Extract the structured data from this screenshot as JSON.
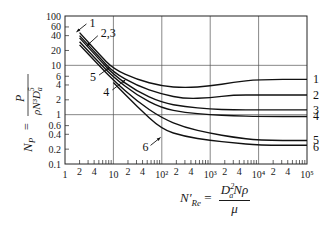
{
  "chart_data": {
    "type": "line",
    "scale": {
      "x": "log",
      "y": "log"
    },
    "title": "",
    "xlabel": "N'_Re = D_a^2 N ρ / μ",
    "ylabel": "N_P = P / (ρ N^3 D_a^5)",
    "xlim": [
      1,
      100000
    ],
    "ylim": [
      0.1,
      100
    ],
    "x_ticks": [
      "1",
      "2",
      "4",
      "10",
      "2",
      "4",
      "10²",
      "2",
      "4",
      "10³",
      "2",
      "4",
      "10⁴",
      "2",
      "4",
      "10⁵"
    ],
    "y_ticks": [
      "0.1",
      "0.2",
      "0.4",
      "0.6",
      "1",
      "2",
      "4",
      "6",
      "10",
      "20",
      "40",
      "60",
      "100"
    ],
    "grid": true,
    "grid_lines": {
      "x": [
        10,
        100,
        1000,
        10000
      ],
      "y": [
        1,
        10
      ]
    },
    "series": [
      {
        "name": "1",
        "x": [
          2,
          5,
          10,
          30,
          100,
          300,
          1000,
          3000,
          10000,
          100000
        ],
        "y": [
          46,
          17,
          8.5,
          5.2,
          3.8,
          3.5,
          3.8,
          4.5,
          5.2,
          5.2
        ]
      },
      {
        "name": "2",
        "x": [
          2,
          5,
          10,
          30,
          100,
          300,
          1000,
          3000,
          10000,
          100000
        ],
        "y": [
          40,
          15,
          7.2,
          3.9,
          2.6,
          2.1,
          2.2,
          2.5,
          2.5,
          2.5
        ]
      },
      {
        "name": "3",
        "x": [
          2,
          5,
          10,
          30,
          100,
          300,
          1000,
          3000,
          10000,
          100000
        ],
        "y": [
          36,
          13.5,
          6.5,
          3.0,
          1.75,
          1.45,
          1.3,
          1.25,
          1.25,
          1.25
        ]
      },
      {
        "name": "4",
        "x": [
          2,
          5,
          10,
          30,
          100,
          300,
          1000,
          3000,
          10000,
          100000
        ],
        "y": [
          30,
          11.5,
          5.8,
          2.5,
          1.35,
          1.1,
          1.0,
          0.95,
          0.92,
          0.92
        ]
      },
      {
        "name": "5",
        "x": [
          2,
          5,
          10,
          30,
          100,
          300,
          1000,
          3000,
          10000,
          100000
        ],
        "y": [
          26,
          10,
          5.0,
          1.9,
          0.85,
          0.55,
          0.42,
          0.35,
          0.3,
          0.3
        ]
      },
      {
        "name": "6",
        "x": [
          10,
          30,
          100,
          300,
          1000,
          3000,
          10000,
          100000
        ],
        "y": [
          4.5,
          1.5,
          0.5,
          0.36,
          0.3,
          0.27,
          0.24,
          0.24
        ]
      }
    ],
    "annotations": [
      {
        "text": "1",
        "at": "left",
        "x": 3.2,
        "y": 60
      },
      {
        "text": "2,3",
        "at": "left",
        "x": 5.5,
        "y": 38
      },
      {
        "text": "5",
        "at": "left",
        "x": 3.3,
        "y": 4.8
      },
      {
        "text": "4",
        "at": "left",
        "x": 6.2,
        "y": 2.4
      },
      {
        "text": "6",
        "at": "middle",
        "x": 40,
        "y": 0.18
      },
      {
        "text": "1",
        "at": "right",
        "y": 5.2
      },
      {
        "text": "2",
        "at": "right",
        "y": 2.5
      },
      {
        "text": "3",
        "at": "right",
        "y": 1.25
      },
      {
        "text": "4",
        "at": "right",
        "y": 0.92
      },
      {
        "text": "5",
        "at": "right",
        "y": 0.3
      },
      {
        "text": "6",
        "at": "right",
        "y": 0.22
      }
    ]
  },
  "labels": {
    "y_lhs": "N",
    "y_lhs_sub": "P",
    "y_eq": "=",
    "y_num": "P",
    "y_den": "ρN³D",
    "y_den_sub": "a",
    "y_den_sup": "5",
    "x_lhs": "N′",
    "x_lhs_sub": "Re",
    "x_eq": "=",
    "x_num": "D",
    "x_num_sub": "a",
    "x_num_sup": "2",
    "x_num_rest": "Nρ",
    "x_den": "μ"
  }
}
